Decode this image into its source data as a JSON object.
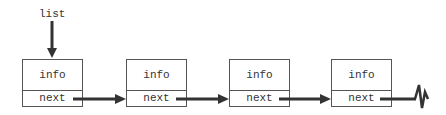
{
  "diagram": {
    "type": "singly-linked-list",
    "head_pointer": {
      "label": "list"
    },
    "nodes": [
      {
        "info": "info",
        "next": "next"
      },
      {
        "info": "info",
        "next": "next"
      },
      {
        "info": "info",
        "next": "next"
      },
      {
        "info": "info",
        "next": "next"
      }
    ],
    "terminator": "null",
    "colors": {
      "stroke": "#555555",
      "arrow": "#333333",
      "text": "#333333"
    }
  }
}
